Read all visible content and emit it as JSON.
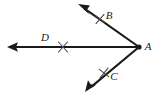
{
  "figure": {
    "type": "geometry-diagram",
    "background_color": "#ffffff",
    "stroke_color": "#1a1a1a",
    "tick_color": "#4a4a4a",
    "vertex": {
      "label": "A",
      "x": 139,
      "y": 47,
      "label_x": 147,
      "label_y": 47,
      "dot_radius": 2.6
    },
    "rays": [
      {
        "name": "ray-AD",
        "label": "D",
        "from_x": 139,
        "from_y": 47,
        "to_x": 7,
        "to_y": 47,
        "label_x": 45,
        "label_y": 38,
        "tick": {
          "x": 63,
          "y": 47,
          "angle": 0
        }
      },
      {
        "name": "ray-AB",
        "label": "B",
        "from_x": 139,
        "from_y": 47,
        "to_x": 78,
        "to_y": 4,
        "label_x": 109,
        "label_y": 16,
        "tick": {
          "x": 100,
          "y": 19,
          "angle": 325
        }
      },
      {
        "name": "ray-AC",
        "label": "C",
        "from_x": 139,
        "from_y": 47,
        "to_x": 85,
        "to_y": 92,
        "label_x": 114,
        "label_y": 77,
        "tick": {
          "x": 104,
          "y": 73,
          "angle": 40
        }
      }
    ]
  }
}
